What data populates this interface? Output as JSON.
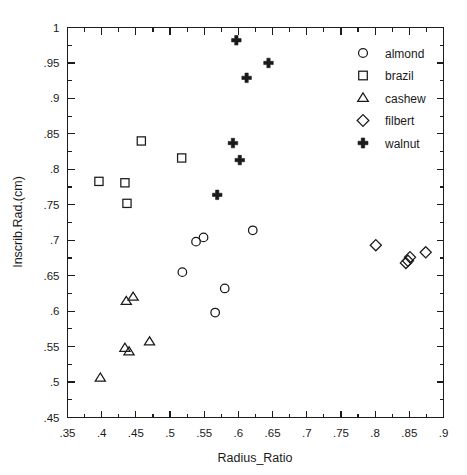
{
  "figure": {
    "width": 467,
    "height": 475,
    "background": "#ffffff",
    "ink_color": "#1a1a1a"
  },
  "chart_data": {
    "type": "scatter",
    "title": "",
    "xlabel": "Radius_Ratio",
    "ylabel": "Inscrib.Rad.(cm)",
    "xlim": [
      0.35,
      0.9
    ],
    "ylim": [
      0.45,
      1.0
    ],
    "xticks": [
      0.35,
      0.4,
      0.45,
      0.5,
      0.55,
      0.6,
      0.65,
      0.7,
      0.75,
      0.8,
      0.85,
      0.9
    ],
    "yticks": [
      0.45,
      0.5,
      0.55,
      0.6,
      0.65,
      0.7,
      0.75,
      0.8,
      0.85,
      0.9,
      0.95,
      1.0
    ],
    "xtick_labels": [
      ".35",
      ".4",
      ".45",
      ".5",
      ".55",
      ".6",
      ".65",
      ".7",
      ".75",
      ".8",
      ".85",
      ".9"
    ],
    "ytick_labels": [
      ".45",
      ".5",
      ".55",
      ".6",
      ".65",
      ".7",
      ".75",
      ".8",
      ".85",
      ".9",
      ".95",
      "1"
    ],
    "minor_ticks": true,
    "grid": false,
    "legend_position": "top-right",
    "series": [
      {
        "name": "almond",
        "marker": "circle",
        "filled": false,
        "points": [
          [
            0.538,
            0.698
          ],
          [
            0.549,
            0.704
          ],
          [
            0.518,
            0.655
          ],
          [
            0.58,
            0.632
          ],
          [
            0.566,
            0.598
          ],
          [
            0.621,
            0.714
          ]
        ]
      },
      {
        "name": "brazil",
        "marker": "square",
        "filled": false,
        "points": [
          [
            0.396,
            0.783
          ],
          [
            0.434,
            0.781
          ],
          [
            0.437,
            0.752
          ],
          [
            0.458,
            0.84
          ],
          [
            0.517,
            0.816
          ]
        ]
      },
      {
        "name": "cashew",
        "marker": "triangle",
        "filled": false,
        "points": [
          [
            0.398,
            0.506
          ],
          [
            0.434,
            0.548
          ],
          [
            0.44,
            0.543
          ],
          [
            0.47,
            0.557
          ],
          [
            0.436,
            0.614
          ],
          [
            0.446,
            0.62
          ]
        ]
      },
      {
        "name": "filbert",
        "marker": "diamond",
        "filled": false,
        "points": [
          [
            0.801,
            0.693
          ],
          [
            0.845,
            0.668
          ],
          [
            0.848,
            0.671
          ],
          [
            0.851,
            0.676
          ],
          [
            0.874,
            0.683
          ]
        ]
      },
      {
        "name": "walnut",
        "marker": "plus",
        "filled": true,
        "points": [
          [
            0.597,
            0.982
          ],
          [
            0.644,
            0.95
          ],
          [
            0.612,
            0.929
          ],
          [
            0.592,
            0.837
          ],
          [
            0.602,
            0.813
          ],
          [
            0.569,
            0.764
          ]
        ]
      }
    ]
  },
  "legend": {
    "entries": [
      {
        "label": "almond",
        "marker": "circle"
      },
      {
        "label": "brazil",
        "marker": "square"
      },
      {
        "label": "cashew",
        "marker": "triangle"
      },
      {
        "label": "filbert",
        "marker": "diamond"
      },
      {
        "label": "walnut",
        "marker": "plus"
      }
    ]
  }
}
